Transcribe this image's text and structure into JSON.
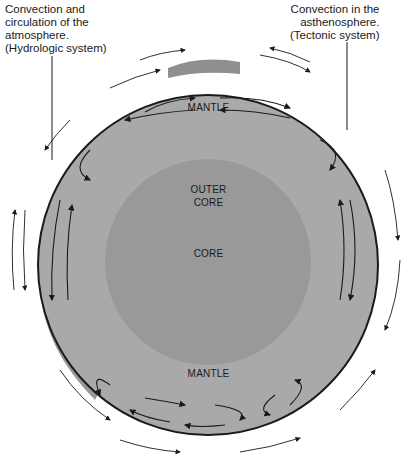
{
  "callouts": {
    "left": {
      "lines": [
        "Convection and",
        "circulation of the",
        "atmosphere.",
        "(Hydrologic system)"
      ]
    },
    "right": {
      "lines": [
        "Convection in the",
        "asthenosphere.",
        "(Tectonic system)"
      ]
    }
  },
  "layers": {
    "mantle_top": "MANTLE",
    "outer_core": [
      "OUTER",
      "CORE"
    ],
    "core": "CORE",
    "mantle_bottom": "MANTLE"
  },
  "colors": {
    "mantle": "#a9a9a9",
    "core": "#999999",
    "crust_patch": "#8f8f8f",
    "outline": "#1a1a1a"
  }
}
